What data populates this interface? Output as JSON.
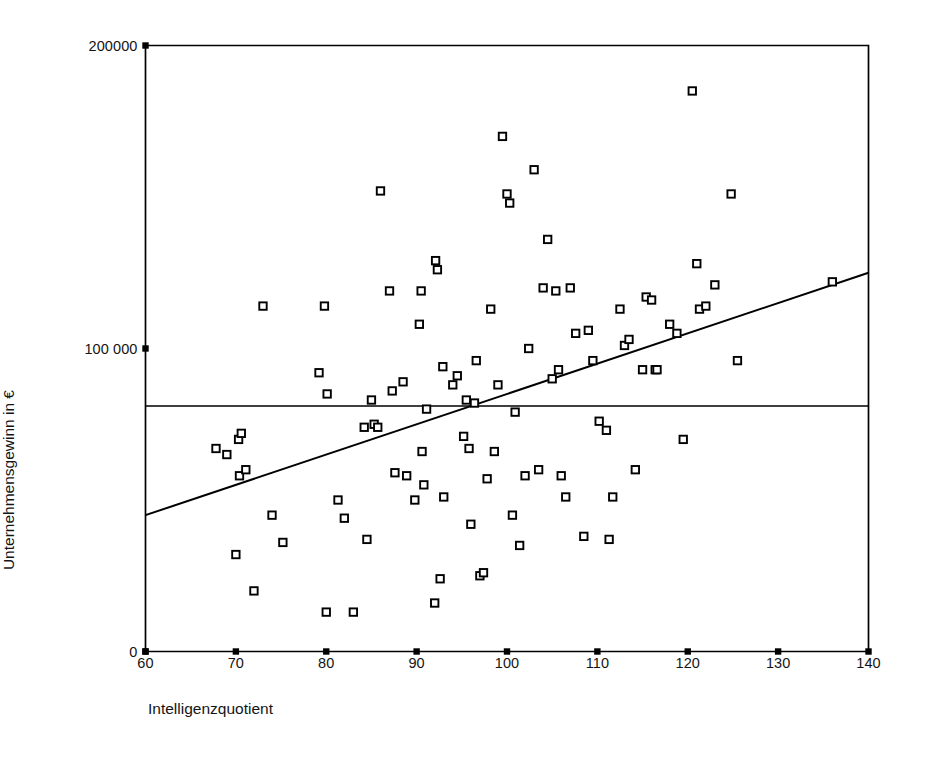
{
  "chart_data": {
    "type": "scatter",
    "title": "",
    "xlabel": "Intelligenzquotient",
    "ylabel": "Unternehmensgewinn in €",
    "xlim": [
      60,
      140
    ],
    "ylim": [
      0,
      200000
    ],
    "grid": false,
    "legend": "none",
    "x_ticks": [
      "60",
      "70",
      "80",
      "90",
      "100",
      "110",
      "120",
      "130",
      "140"
    ],
    "x_tick_values": [
      60,
      70,
      80,
      90,
      100,
      110,
      120,
      130,
      140
    ],
    "y_ticks": [
      "0",
      "100 000",
      "200000"
    ],
    "y_tick_values": [
      0,
      100000,
      200000
    ],
    "marker": "open-square",
    "marker_color": "#000000",
    "line_color": "#000000",
    "background": "#ffffff",
    "points": [
      [
        67.8,
        67000
      ],
      [
        69.0,
        65000
      ],
      [
        70.0,
        32000
      ],
      [
        70.3,
        70000
      ],
      [
        70.6,
        72000
      ],
      [
        70.4,
        58000
      ],
      [
        71.1,
        60000
      ],
      [
        72.0,
        20000
      ],
      [
        73.0,
        114000
      ],
      [
        74.0,
        45000
      ],
      [
        75.2,
        36000
      ],
      [
        79.2,
        92000
      ],
      [
        79.8,
        114000
      ],
      [
        80.0,
        13000
      ],
      [
        80.1,
        85000
      ],
      [
        81.3,
        50000
      ],
      [
        82.0,
        44000
      ],
      [
        83.0,
        13000
      ],
      [
        84.2,
        74000
      ],
      [
        84.5,
        37000
      ],
      [
        85.0,
        83000
      ],
      [
        85.3,
        75000
      ],
      [
        85.7,
        74000
      ],
      [
        86.0,
        152000
      ],
      [
        87.0,
        119000
      ],
      [
        87.3,
        86000
      ],
      [
        87.6,
        59000
      ],
      [
        88.5,
        89000
      ],
      [
        88.9,
        58000
      ],
      [
        89.8,
        50000
      ],
      [
        90.3,
        108000
      ],
      [
        90.5,
        119000
      ],
      [
        90.6,
        66000
      ],
      [
        90.8,
        55000
      ],
      [
        91.1,
        80000
      ],
      [
        92.0,
        16000
      ],
      [
        92.1,
        129000
      ],
      [
        92.3,
        126000
      ],
      [
        92.6,
        24000
      ],
      [
        92.9,
        94000
      ],
      [
        93.0,
        51000
      ],
      [
        94.0,
        88000
      ],
      [
        94.5,
        91000
      ],
      [
        95.2,
        71000
      ],
      [
        95.5,
        83000
      ],
      [
        95.8,
        67000
      ],
      [
        96.0,
        42000
      ],
      [
        96.4,
        82000
      ],
      [
        96.6,
        96000
      ],
      [
        97.0,
        25000
      ],
      [
        97.4,
        26000
      ],
      [
        97.8,
        57000
      ],
      [
        98.2,
        113000
      ],
      [
        98.6,
        66000
      ],
      [
        99.0,
        88000
      ],
      [
        99.5,
        170000
      ],
      [
        100.0,
        151000
      ],
      [
        100.3,
        148000
      ],
      [
        100.6,
        45000
      ],
      [
        100.9,
        79000
      ],
      [
        101.4,
        35000
      ],
      [
        102.0,
        58000
      ],
      [
        102.4,
        100000
      ],
      [
        103.0,
        159000
      ],
      [
        103.5,
        60000
      ],
      [
        104.0,
        120000
      ],
      [
        104.5,
        136000
      ],
      [
        105.0,
        90000
      ],
      [
        105.4,
        119000
      ],
      [
        105.7,
        93000
      ],
      [
        106.0,
        58000
      ],
      [
        106.5,
        51000
      ],
      [
        107.0,
        120000
      ],
      [
        107.6,
        105000
      ],
      [
        108.5,
        38000
      ],
      [
        109.0,
        106000
      ],
      [
        109.5,
        96000
      ],
      [
        110.2,
        76000
      ],
      [
        111.0,
        73000
      ],
      [
        111.3,
        37000
      ],
      [
        111.7,
        51000
      ],
      [
        112.5,
        113000
      ],
      [
        113.0,
        101000
      ],
      [
        113.5,
        103000
      ],
      [
        114.2,
        60000
      ],
      [
        115.0,
        93000
      ],
      [
        115.4,
        117000
      ],
      [
        116.0,
        116000
      ],
      [
        116.4,
        93000
      ],
      [
        116.6,
        93000
      ],
      [
        118.0,
        108000
      ],
      [
        118.8,
        105000
      ],
      [
        119.5,
        70000
      ],
      [
        120.5,
        185000
      ],
      [
        121.0,
        128000
      ],
      [
        121.3,
        113000
      ],
      [
        122.0,
        114000
      ],
      [
        123.0,
        121000
      ],
      [
        124.8,
        151000
      ],
      [
        125.5,
        96000
      ],
      [
        136.0,
        122000
      ]
    ],
    "trend_line": {
      "label": "regression-line",
      "x0": 60,
      "y0": 45000,
      "x1": 140,
      "y1": 125000
    },
    "reference_line": {
      "label": "mean-horizontal-line",
      "y": 81000,
      "orientation": "horizontal"
    }
  }
}
